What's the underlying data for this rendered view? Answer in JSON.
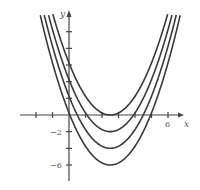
{
  "chart_data": {
    "type": "line",
    "title": "",
    "xlabel": "x",
    "ylabel": "y",
    "xlim": [
      -3,
      7
    ],
    "ylim": [
      -7.5,
      12
    ],
    "grid": false,
    "legend": "none",
    "x_ticks": [
      -2,
      -1,
      0,
      1,
      2,
      3,
      4,
      5,
      6
    ],
    "x_tick_labels": [
      {
        "value": 6,
        "label": "6"
      }
    ],
    "y_ticks": [
      -6,
      -4,
      -2,
      2,
      4,
      6,
      8,
      10
    ],
    "y_tick_labels": [
      {
        "value": -2,
        "label": "−2"
      },
      {
        "value": -6,
        "label": "−6"
      }
    ],
    "series": [
      {
        "name": "C = 0",
        "formula": "(x-2.5)^2",
        "vertex": [
          2.5,
          0
        ]
      },
      {
        "name": "C = -2",
        "formula": "(x-2.5)^2-2",
        "vertex": [
          2.5,
          -2
        ]
      },
      {
        "name": "C = -4",
        "formula": "(x-2.5)^2-4",
        "vertex": [
          2.5,
          -4
        ]
      },
      {
        "name": "C = -6",
        "formula": "(x-2.5)^2-6",
        "vertex": [
          2.5,
          -6
        ]
      }
    ],
    "offsets": [
      0,
      -2,
      -4,
      -6
    ],
    "h": 2.5
  },
  "colors": {
    "axis": "#444444",
    "curve": "#3a3a3a"
  }
}
